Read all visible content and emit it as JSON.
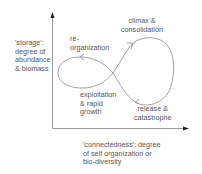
{
  "diagram": {
    "type": "adaptive-cycle",
    "axes": {
      "y_label": "'storage':\ndegree of\nabundance\n& biomass",
      "x_label": "'connectedness': degree\nof self organization or\nbio-diversity"
    },
    "phases": [
      {
        "id": "reorganization",
        "label": "re-\norganization"
      },
      {
        "id": "climax",
        "label": "climax &\nconsolidation"
      },
      {
        "id": "exploitation",
        "label": "exploitation\n& rapid\ngrowth"
      },
      {
        "id": "release",
        "label": "release &\ncatastrophe"
      }
    ],
    "colors": {
      "axis": "#333333",
      "curve": "#888888",
      "text": "#555555"
    }
  }
}
